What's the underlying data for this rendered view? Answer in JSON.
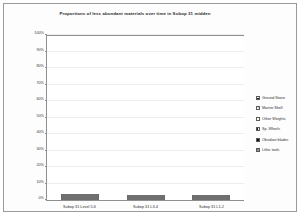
{
  "chart_data": {
    "type": "bar",
    "subtype": "stacked-percent",
    "title": "Proportions of less abundant materials over time in Subop 31 midden",
    "xlabel": "",
    "ylabel": "",
    "ylim": [
      0,
      100
    ],
    "yticks": [
      "0%",
      "10%",
      "20%",
      "30%",
      "40%",
      "50%",
      "60%",
      "70%",
      "80%",
      "90%",
      "100%"
    ],
    "grid": true,
    "legend_position": "right",
    "categories": [
      "Subop 31 Level 5-6",
      "Subop 31 L3-4",
      "Subop 31 L1-2"
    ],
    "series": [
      {
        "name": "Lithic tools",
        "pattern": "solid-grey",
        "values": [
          7,
          5,
          7
        ]
      },
      {
        "name": "Obsidian blades",
        "pattern": "solid-black",
        "values": [
          24,
          20,
          12
        ]
      },
      {
        "name": "Sp. Whorls",
        "pattern": "vertical-stripes",
        "values": [
          3,
          0,
          4
        ]
      },
      {
        "name": "Other Weights",
        "pattern": "white",
        "values": [
          34,
          11,
          46
        ]
      },
      {
        "name": "Marine Shell",
        "pattern": "checker-grey",
        "values": [
          30,
          50,
          31
        ]
      },
      {
        "name": "Ground Stone",
        "pattern": "horizontal-stripes",
        "values": [
          2,
          14,
          0
        ]
      }
    ]
  },
  "legend": {
    "items": [
      {
        "label": "Ground Stone"
      },
      {
        "label": "Marine Shell"
      },
      {
        "label": "Other Weights"
      },
      {
        "label": "Sp. Whorls"
      },
      {
        "label": "Obsidian blades"
      },
      {
        "label": "Lithic tools"
      }
    ]
  },
  "colors": {
    "frame": "#9a9a9a",
    "axis": "#8f8f8f",
    "grid": "#ededed",
    "text": "#2e2e2e",
    "black_fill": "#0d0d0d",
    "grey_fill": "#8c8c8c",
    "checker_fill": "#b4b4b4"
  }
}
